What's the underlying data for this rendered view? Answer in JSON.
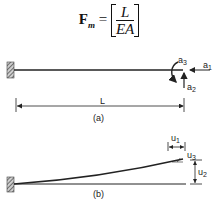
{
  "equation": {
    "lhs": "F",
    "lhs_sub": "m",
    "equals": "=",
    "numerator": "L",
    "denominator": "EA"
  },
  "figure_a": {
    "caption": "(a)",
    "length_label": "L",
    "actions": [
      {
        "id": "a1",
        "label": "a",
        "sub": "1"
      },
      {
        "id": "a2",
        "label": "a",
        "sub": "2"
      },
      {
        "id": "a3",
        "label": "a",
        "sub": "3"
      }
    ]
  },
  "figure_b": {
    "caption": "(b)",
    "displacements": [
      {
        "id": "u1",
        "label": "u",
        "sub": "1"
      },
      {
        "id": "u2",
        "label": "u",
        "sub": "2"
      },
      {
        "id": "u3",
        "label": "u",
        "sub": "3"
      }
    ]
  },
  "colors": {
    "line": "#222222",
    "hatch": "#555555"
  }
}
